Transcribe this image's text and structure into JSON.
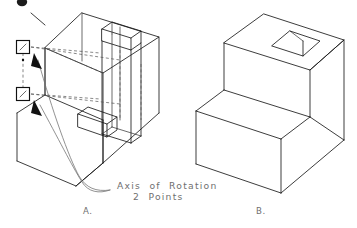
{
  "figure": {
    "annotation": {
      "line1": "Axis  of  Rotation",
      "line2": "2  Points"
    },
    "labels": {
      "left": "A.",
      "right": "B."
    },
    "markers": [
      {
        "name": "axis-point-upper",
        "x": 23,
        "y": 47
      },
      {
        "name": "axis-point-lower",
        "x": 23,
        "y": 94
      }
    ],
    "colors": {
      "line": "#1a1a1a",
      "hidden": "#555555",
      "leader": "#6d6d6d",
      "text": "#6f6f6f",
      "background": "#ffffff"
    },
    "panels": [
      {
        "id": "A",
        "caption": "A.",
        "description": "wireframe isometric stepped block with vertical rotation prism and two axis snap points"
      },
      {
        "id": "B",
        "caption": "B.",
        "description": "solid isometric L-shaped step block with square through hole in top face"
      }
    ]
  }
}
